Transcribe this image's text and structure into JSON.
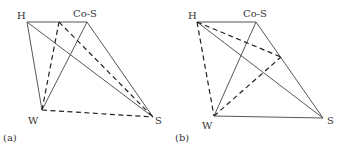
{
  "figure": {
    "panels": [
      {
        "id": "a",
        "caption": "(a)",
        "vertices": {
          "H": {
            "label": "H",
            "x": 27,
            "y": 22
          },
          "CoS": {
            "label": "Co-S",
            "x": 87,
            "y": 22
          },
          "W": {
            "label": "W",
            "x": 42,
            "y": 110
          },
          "S": {
            "label": "S",
            "x": 153,
            "y": 117
          }
        },
        "solid_edges": [
          [
            "H",
            "CoS"
          ],
          [
            "H",
            "W"
          ],
          [
            "H",
            "S"
          ],
          [
            "CoS",
            "W"
          ],
          [
            "CoS",
            "S"
          ]
        ],
        "dashed_edges": [
          [
            "W",
            "S"
          ],
          [
            "W",
            "P"
          ],
          [
            "P",
            "S"
          ]
        ],
        "extra_points": {
          "P": {
            "x": 59,
            "y": 22
          }
        }
      },
      {
        "id": "b",
        "caption": "(b)",
        "vertices": {
          "H": {
            "label": "H",
            "x": 197,
            "y": 22
          },
          "CoS": {
            "label": "Co-S",
            "x": 256,
            "y": 22
          },
          "W": {
            "label": "W",
            "x": 214,
            "y": 116
          },
          "S": {
            "label": "S",
            "x": 323,
            "y": 118
          }
        },
        "solid_edges": [
          [
            "H",
            "CoS"
          ],
          [
            "CoS",
            "W"
          ],
          [
            "CoS",
            "S"
          ],
          [
            "H",
            "S"
          ],
          [
            "W",
            "S"
          ]
        ],
        "dashed_edges": [
          [
            "H",
            "W"
          ],
          [
            "H",
            "Q"
          ],
          [
            "W",
            "Q"
          ]
        ],
        "extra_points": {
          "Q": {
            "x": 281,
            "y": 57
          }
        }
      }
    ]
  }
}
